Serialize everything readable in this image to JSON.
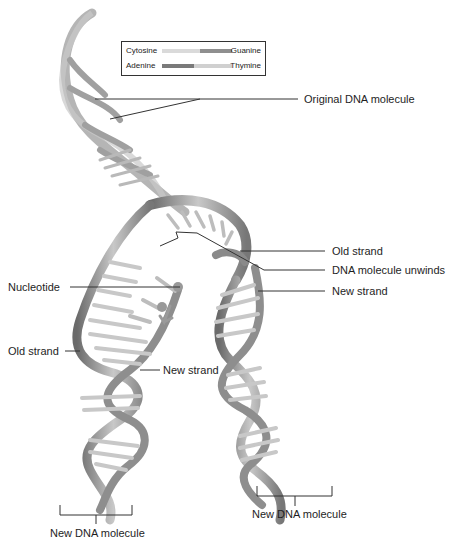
{
  "diagram": {
    "type": "dna-replication",
    "legend": {
      "pairs": [
        {
          "left": "Cytosine",
          "right": "Guanine",
          "left_color": "#d9d9d9",
          "right_color": "#8a8a8a"
        },
        {
          "left": "Adenine",
          "right": "Thymine",
          "left_color": "#7a7a7a",
          "right_color": "#cfcfcf"
        }
      ]
    },
    "labels": {
      "original_dna_molecule": "Original DNA molecule",
      "old_strand_right": "Old strand",
      "dna_molecule_unwinds": "DNA molecule unwinds",
      "new_strand_right": "New strand",
      "nucleotide": "Nucleotide",
      "old_strand_left": "Old strand",
      "new_strand_center": "New strand",
      "new_dna_molecule_left": "New DNA molecule",
      "new_dna_molecule_right": "New DNA molecule"
    },
    "colors": {
      "strand": "#9a9a9a",
      "strand_dark": "#6e6e6e",
      "base_light": "#e0e0e0",
      "base_dark": "#8c8c8c",
      "leader_line": "#333333"
    }
  }
}
